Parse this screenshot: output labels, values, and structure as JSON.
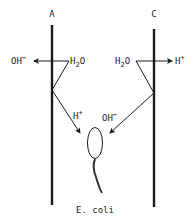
{
  "diagram": {
    "electrodes": [
      {
        "id": "A",
        "label": "A"
      },
      {
        "id": "C",
        "label": "C"
      }
    ],
    "left": {
      "water": {
        "main": "H",
        "sub": "2",
        "tail": "O"
      },
      "product_out": {
        "main": "OH",
        "sup": "−"
      },
      "product_in": {
        "main": "H",
        "sup": "+"
      }
    },
    "right": {
      "water": {
        "main": "H",
        "sub": "2",
        "tail": "O"
      },
      "product_out": {
        "main": "H",
        "sup": "+"
      },
      "product_in": {
        "main": "OH",
        "sup": "−"
      }
    },
    "organism": {
      "label": "E. coli"
    },
    "colors": {
      "ink": "#1a1a1a",
      "background": "#ffffff"
    }
  }
}
